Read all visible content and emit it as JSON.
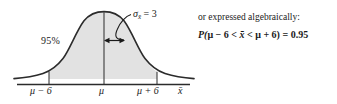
{
  "figure": {
    "type": "normal-distribution-curve",
    "colors": {
      "curve": "#2b2b2b",
      "shading": "#e2e2e2",
      "axis": "#2b2b2b",
      "text": "#1a1a1a",
      "background": "#ffffff"
    },
    "shaded_area_label": "95%",
    "sd_label": {
      "symbol": "σ",
      "subscript": "x̄",
      "relation": "=",
      "value": "3",
      "full": "σx̄ = 3"
    },
    "axis": {
      "name": "x̄",
      "ticks": [
        {
          "id": "lower",
          "label": "μ − 6"
        },
        {
          "id": "mean",
          "label": "μ"
        },
        {
          "id": "upper",
          "label": "μ + 6"
        }
      ]
    },
    "annotations": {
      "sd_arrow": "double-headed arrow spanning one standard deviation right of the mean",
      "leader_line": "line from sigma label to curve"
    }
  },
  "algebraic": {
    "intro": "or expressed algebraically:",
    "statement": {
      "prefix": "P(",
      "lower_bound": "μ − 6",
      "op_left": "<",
      "variable": "x̄",
      "op_right": "<",
      "upper_bound": "μ + 6",
      "suffix": ")",
      "equals": "=",
      "probability": "0.95",
      "full": "P(μ − 6 < x̄ < μ + 6) = 0.95"
    }
  }
}
